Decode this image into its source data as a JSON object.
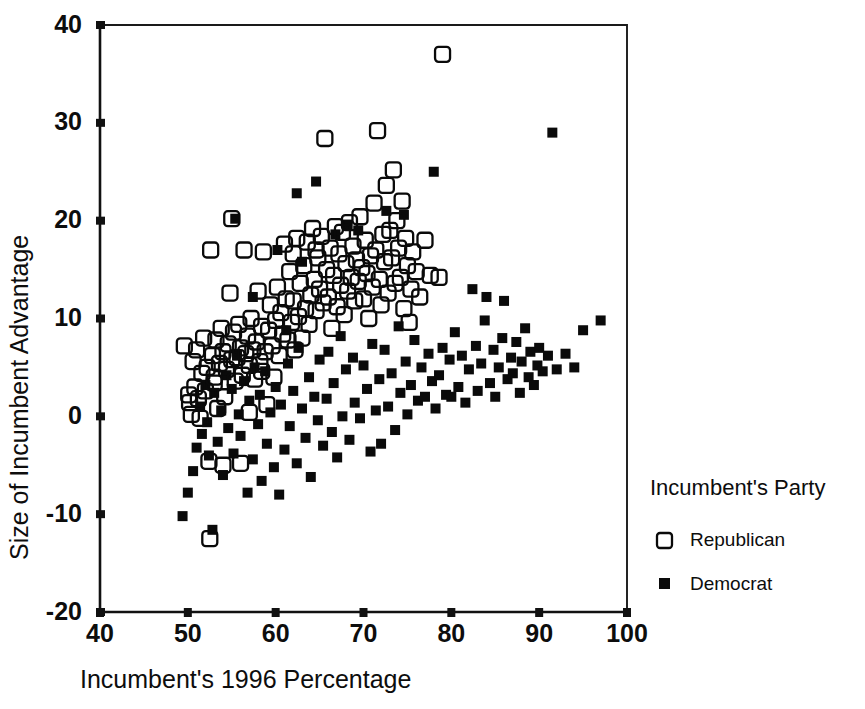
{
  "chart_data": {
    "type": "scatter",
    "title": "",
    "xlabel": "Incumbent's 1996 Percentage",
    "ylabel": "Size of Incumbent Advantage",
    "xlim": [
      40,
      100
    ],
    "ylim": [
      -20,
      40
    ],
    "xticks": [
      40,
      50,
      60,
      70,
      80,
      90,
      100
    ],
    "yticks": [
      -20,
      -10,
      0,
      10,
      20,
      30,
      40
    ],
    "grid": false,
    "legend_position": "right",
    "legend_title": "Incumbent's Party",
    "series": [
      {
        "name": "Republican",
        "marker": "open-square",
        "color": "#0a0a0a",
        "points": [
          [
            49.6,
            7.2
          ],
          [
            50.1,
            2.2
          ],
          [
            50.2,
            1.4
          ],
          [
            50.4,
            0.2
          ],
          [
            50.6,
            5.6
          ],
          [
            50.8,
            3.0
          ],
          [
            51.0,
            6.8
          ],
          [
            51.2,
            1.8
          ],
          [
            51.4,
            -0.2
          ],
          [
            51.6,
            4.4
          ],
          [
            51.8,
            8.0
          ],
          [
            52.0,
            2.6
          ],
          [
            52.2,
            5.0
          ],
          [
            52.4,
            -4.6
          ],
          [
            52.5,
            -12.5
          ],
          [
            52.6,
            17.0
          ],
          [
            52.8,
            6.2
          ],
          [
            53.0,
            3.4
          ],
          [
            53.2,
            7.8
          ],
          [
            53.4,
            0.8
          ],
          [
            53.6,
            5.4
          ],
          [
            53.8,
            9.0
          ],
          [
            54.0,
            6.6
          ],
          [
            54.2,
            2.0
          ],
          [
            54.4,
            4.8
          ],
          [
            54.6,
            7.4
          ],
          [
            54.8,
            12.6
          ],
          [
            55.0,
            5.8
          ],
          [
            55.2,
            8.6
          ],
          [
            55.4,
            3.6
          ],
          [
            55.6,
            6.0
          ],
          [
            55.8,
            9.4
          ],
          [
            56.0,
            7.0
          ],
          [
            56.2,
            4.2
          ],
          [
            56.4,
            17.0
          ],
          [
            56.6,
            6.4
          ],
          [
            56.8,
            8.2
          ],
          [
            57.0,
            5.2
          ],
          [
            57.2,
            10.0
          ],
          [
            57.4,
            6.8
          ],
          [
            57.6,
            3.8
          ],
          [
            57.8,
            7.6
          ],
          [
            58.0,
            12.8
          ],
          [
            58.2,
            5.6
          ],
          [
            58.4,
            9.2
          ],
          [
            58.6,
            16.8
          ],
          [
            58.8,
            6.6
          ],
          [
            59.0,
            1.2
          ],
          [
            59.2,
            8.8
          ],
          [
            59.4,
            11.4
          ],
          [
            59.6,
            7.2
          ],
          [
            59.8,
            4.0
          ],
          [
            60.0,
            9.8
          ],
          [
            60.2,
            13.2
          ],
          [
            60.4,
            6.2
          ],
          [
            60.6,
            10.6
          ],
          [
            60.8,
            8.4
          ],
          [
            61.0,
            17.6
          ],
          [
            61.2,
            12.0
          ],
          [
            61.4,
            7.8
          ],
          [
            61.6,
            14.8
          ],
          [
            61.8,
            9.6
          ],
          [
            62.0,
            11.8
          ],
          [
            62.2,
            6.8
          ],
          [
            62.4,
            18.2
          ],
          [
            62.6,
            10.2
          ],
          [
            62.8,
            13.6
          ],
          [
            63.0,
            8.0
          ],
          [
            63.2,
            15.4
          ],
          [
            63.4,
            11.0
          ],
          [
            63.6,
            17.8
          ],
          [
            63.8,
            9.4
          ],
          [
            64.0,
            12.4
          ],
          [
            64.2,
            19.2
          ],
          [
            64.4,
            14.0
          ],
          [
            64.6,
            10.8
          ],
          [
            64.8,
            16.2
          ],
          [
            65.0,
            13.0
          ],
          [
            65.2,
            18.4
          ],
          [
            65.4,
            11.6
          ],
          [
            65.6,
            28.4
          ],
          [
            65.8,
            15.0
          ],
          [
            66.0,
            12.2
          ],
          [
            66.2,
            17.2
          ],
          [
            66.4,
            9.0
          ],
          [
            66.6,
            14.4
          ],
          [
            66.8,
            19.4
          ],
          [
            67.0,
            11.2
          ],
          [
            67.2,
            16.6
          ],
          [
            67.4,
            13.4
          ],
          [
            67.6,
            18.8
          ],
          [
            67.8,
            10.4
          ],
          [
            68.0,
            15.6
          ],
          [
            68.2,
            12.8
          ],
          [
            68.4,
            19.8
          ],
          [
            68.6,
            14.2
          ],
          [
            68.8,
            17.4
          ],
          [
            69.0,
            11.8
          ],
          [
            69.2,
            16.0
          ],
          [
            69.4,
            13.8
          ],
          [
            69.6,
            20.4
          ],
          [
            69.8,
            15.2
          ],
          [
            70.0,
            12.0
          ],
          [
            70.2,
            18.0
          ],
          [
            70.4,
            14.6
          ],
          [
            70.6,
            10.0
          ],
          [
            70.8,
            16.4
          ],
          [
            71.0,
            13.2
          ],
          [
            71.2,
            21.8
          ],
          [
            71.4,
            17.0
          ],
          [
            71.6,
            29.2
          ],
          [
            71.8,
            14.0
          ],
          [
            72.0,
            11.4
          ],
          [
            72.2,
            18.6
          ],
          [
            72.4,
            15.8
          ],
          [
            72.6,
            23.6
          ],
          [
            72.8,
            12.6
          ],
          [
            73.0,
            19.0
          ],
          [
            73.2,
            16.2
          ],
          [
            73.4,
            25.2
          ],
          [
            73.6,
            13.6
          ],
          [
            73.8,
            20.0
          ],
          [
            74.0,
            17.2
          ],
          [
            74.2,
            14.2
          ],
          [
            74.4,
            22.0
          ],
          [
            74.6,
            11.0
          ],
          [
            74.8,
            18.2
          ],
          [
            75.0,
            15.4
          ],
          [
            75.2,
            9.6
          ],
          [
            75.4,
            13.0
          ],
          [
            75.6,
            16.8
          ],
          [
            76.0,
            14.8
          ],
          [
            76.4,
            12.2
          ],
          [
            77.0,
            18.0
          ],
          [
            77.6,
            14.4
          ],
          [
            78.6,
            14.2
          ],
          [
            79.0,
            37.0
          ],
          [
            55.0,
            20.2
          ],
          [
            62.0,
            16.6
          ],
          [
            64.6,
            17.0
          ],
          [
            58.4,
            4.6
          ],
          [
            57.0,
            0.4
          ],
          [
            53.0,
            4.0
          ],
          [
            56.0,
            -4.8
          ],
          [
            54.0,
            -5.0
          ]
        ]
      },
      {
        "name": "Democrat",
        "marker": "filled-square",
        "color": "#0a0a0a",
        "points": [
          [
            49.4,
            -10.2
          ],
          [
            50.0,
            -7.8
          ],
          [
            50.6,
            -5.6
          ],
          [
            51.0,
            -3.2
          ],
          [
            51.4,
            1.0
          ],
          [
            51.6,
            -1.8
          ],
          [
            52.0,
            3.2
          ],
          [
            52.2,
            -0.6
          ],
          [
            52.4,
            -4.0
          ],
          [
            52.8,
            -11.6
          ],
          [
            53.0,
            2.4
          ],
          [
            53.4,
            -2.6
          ],
          [
            53.8,
            0.6
          ],
          [
            54.0,
            -6.0
          ],
          [
            54.4,
            4.2
          ],
          [
            54.6,
            -1.2
          ],
          [
            55.0,
            2.8
          ],
          [
            55.2,
            -3.8
          ],
          [
            55.6,
            6.2
          ],
          [
            55.8,
            0.2
          ],
          [
            56.0,
            -2.0
          ],
          [
            56.4,
            3.6
          ],
          [
            56.8,
            -7.8
          ],
          [
            57.0,
            1.6
          ],
          [
            57.4,
            -4.4
          ],
          [
            57.6,
            5.0
          ],
          [
            58.0,
            -0.8
          ],
          [
            58.2,
            2.2
          ],
          [
            58.4,
            -6.6
          ],
          [
            58.8,
            4.6
          ],
          [
            59.0,
            -2.8
          ],
          [
            59.4,
            0.4
          ],
          [
            59.8,
            -5.2
          ],
          [
            60.0,
            3.0
          ],
          [
            60.4,
            -8.0
          ],
          [
            60.6,
            1.2
          ],
          [
            61.0,
            -3.4
          ],
          [
            61.4,
            5.4
          ],
          [
            61.6,
            -1.0
          ],
          [
            62.0,
            2.6
          ],
          [
            62.4,
            -4.8
          ],
          [
            62.6,
            7.0
          ],
          [
            63.0,
            0.8
          ],
          [
            63.4,
            -2.2
          ],
          [
            63.8,
            4.0
          ],
          [
            64.0,
            -6.2
          ],
          [
            64.4,
            2.0
          ],
          [
            64.6,
            24.0
          ],
          [
            64.8,
            -0.4
          ],
          [
            65.0,
            5.8
          ],
          [
            65.4,
            -3.0
          ],
          [
            65.8,
            1.8
          ],
          [
            66.0,
            6.6
          ],
          [
            66.4,
            -1.6
          ],
          [
            66.6,
            3.4
          ],
          [
            67.0,
            -4.2
          ],
          [
            67.4,
            8.2
          ],
          [
            67.6,
            0.0
          ],
          [
            68.0,
            4.8
          ],
          [
            68.4,
            -2.4
          ],
          [
            68.8,
            6.0
          ],
          [
            69.0,
            1.4
          ],
          [
            69.4,
            19.0
          ],
          [
            69.6,
            -0.2
          ],
          [
            70.0,
            5.2
          ],
          [
            70.4,
            2.8
          ],
          [
            70.8,
            -3.6
          ],
          [
            71.0,
            7.4
          ],
          [
            71.4,
            0.6
          ],
          [
            71.8,
            3.8
          ],
          [
            72.0,
            -2.8
          ],
          [
            72.4,
            6.8
          ],
          [
            72.6,
            21.0
          ],
          [
            72.8,
            1.0
          ],
          [
            73.2,
            4.4
          ],
          [
            73.6,
            -1.4
          ],
          [
            74.0,
            9.2
          ],
          [
            74.2,
            2.4
          ],
          [
            74.6,
            20.6
          ],
          [
            74.8,
            5.6
          ],
          [
            75.0,
            0.2
          ],
          [
            75.4,
            3.2
          ],
          [
            75.8,
            7.8
          ],
          [
            76.2,
            1.6
          ],
          [
            76.6,
            5.0
          ],
          [
            77.0,
            2.0
          ],
          [
            77.4,
            6.4
          ],
          [
            77.8,
            3.6
          ],
          [
            78.0,
            25.0
          ],
          [
            78.2,
            0.8
          ],
          [
            78.6,
            4.2
          ],
          [
            79.0,
            7.0
          ],
          [
            79.4,
            2.2
          ],
          [
            79.8,
            5.8
          ],
          [
            80.0,
            2.0
          ],
          [
            80.4,
            8.6
          ],
          [
            80.8,
            3.0
          ],
          [
            81.2,
            6.2
          ],
          [
            81.6,
            1.4
          ],
          [
            82.0,
            4.8
          ],
          [
            82.4,
            13.0
          ],
          [
            82.8,
            7.2
          ],
          [
            83.0,
            2.6
          ],
          [
            83.4,
            5.4
          ],
          [
            83.8,
            9.8
          ],
          [
            84.0,
            12.2
          ],
          [
            84.4,
            3.4
          ],
          [
            84.8,
            6.8
          ],
          [
            85.0,
            2.0
          ],
          [
            85.4,
            5.0
          ],
          [
            85.8,
            8.0
          ],
          [
            86.0,
            11.8
          ],
          [
            86.4,
            3.8
          ],
          [
            86.8,
            6.0
          ],
          [
            87.0,
            4.4
          ],
          [
            87.4,
            7.6
          ],
          [
            87.8,
            2.4
          ],
          [
            88.0,
            5.6
          ],
          [
            88.4,
            9.0
          ],
          [
            88.8,
            4.0
          ],
          [
            89.0,
            6.6
          ],
          [
            89.4,
            3.2
          ],
          [
            89.8,
            5.2
          ],
          [
            90.0,
            7.0
          ],
          [
            90.4,
            4.6
          ],
          [
            91.0,
            6.2
          ],
          [
            91.5,
            29.0
          ],
          [
            92.0,
            4.8
          ],
          [
            93.0,
            6.4
          ],
          [
            94.0,
            5.0
          ],
          [
            95.0,
            8.8
          ],
          [
            97.0,
            9.8
          ],
          [
            60.2,
            17.0
          ],
          [
            62.4,
            22.8
          ],
          [
            66.8,
            18.6
          ],
          [
            68.2,
            19.6
          ],
          [
            57.4,
            12.2
          ],
          [
            55.4,
            20.2
          ],
          [
            63.0,
            15.8
          ],
          [
            61.2,
            8.8
          ]
        ]
      }
    ]
  },
  "legend": {
    "title": "Incumbent's Party",
    "entries": [
      {
        "label": "Republican",
        "marker": "open-square"
      },
      {
        "label": "Democrat",
        "marker": "filled-square"
      }
    ]
  },
  "axes": {
    "x_title": "Incumbent's 1996 Percentage",
    "y_title": "Size of Incumbent Advantage",
    "x_tick_labels": [
      "40",
      "50",
      "60",
      "70",
      "80",
      "90",
      "100"
    ],
    "y_tick_labels": [
      "40",
      "30",
      "20",
      "10",
      "0",
      "-10",
      "-20"
    ]
  },
  "colors": {
    "ink": "#0a0a0a",
    "background": "#ffffff"
  }
}
